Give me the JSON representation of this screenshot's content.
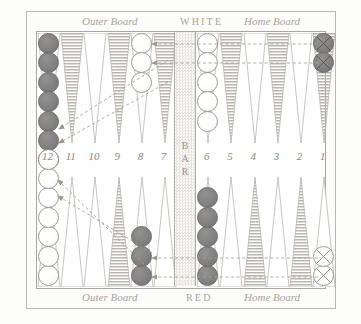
{
  "board": {
    "title_top_center": "WHITE",
    "title_bottom_center": "RED",
    "label_outer_board": "Outer Board",
    "label_home_board": "Home Board",
    "bar_label": "BAR",
    "colors": {
      "red_checker": "#807f80",
      "white_checker": "#fdfdfc",
      "point_hatch": "#b4b1ab",
      "frame": "#b9b6ad",
      "text": "#a9a39a",
      "arrow": "#a39d94"
    },
    "point_numbers": [
      "12",
      "11",
      "10",
      "9",
      "8",
      "7",
      "6",
      "5",
      "4",
      "3",
      "2",
      "1"
    ],
    "top_points": [
      {
        "number": "12",
        "checkers": 7,
        "color": "red",
        "hatched": false,
        "marked": false
      },
      {
        "number": "11",
        "checkers": 0,
        "color": "none",
        "hatched": true,
        "marked": false
      },
      {
        "number": "10",
        "checkers": 0,
        "color": "none",
        "hatched": false,
        "marked": false
      },
      {
        "number": "9",
        "checkers": 0,
        "color": "none",
        "hatched": true,
        "marked": false
      },
      {
        "number": "8",
        "checkers": 3,
        "color": "white",
        "hatched": false,
        "marked": false
      },
      {
        "number": "7",
        "checkers": 0,
        "color": "none",
        "hatched": true,
        "marked": false
      },
      {
        "number": "6",
        "checkers": 5,
        "color": "white",
        "hatched": false,
        "marked": false
      },
      {
        "number": "5",
        "checkers": 0,
        "color": "none",
        "hatched": true,
        "marked": false
      },
      {
        "number": "4",
        "checkers": 0,
        "color": "none",
        "hatched": false,
        "marked": false
      },
      {
        "number": "3",
        "checkers": 0,
        "color": "none",
        "hatched": true,
        "marked": false
      },
      {
        "number": "2",
        "checkers": 0,
        "color": "none",
        "hatched": false,
        "marked": false
      },
      {
        "number": "1",
        "checkers": 2,
        "color": "red",
        "hatched": true,
        "marked": true
      }
    ],
    "bottom_points": [
      {
        "number": "12",
        "checkers": 7,
        "color": "white",
        "hatched": false,
        "marked": false
      },
      {
        "number": "11",
        "checkers": 0,
        "color": "none",
        "hatched": false,
        "marked": false
      },
      {
        "number": "10",
        "checkers": 0,
        "color": "none",
        "hatched": false,
        "marked": false
      },
      {
        "number": "9",
        "checkers": 0,
        "color": "none",
        "hatched": true,
        "marked": false
      },
      {
        "number": "8",
        "checkers": 3,
        "color": "red",
        "hatched": false,
        "marked": false
      },
      {
        "number": "7",
        "checkers": 0,
        "color": "none",
        "hatched": false,
        "marked": false
      },
      {
        "number": "6",
        "checkers": 5,
        "color": "red",
        "hatched": false,
        "marked": false
      },
      {
        "number": "5",
        "checkers": 0,
        "color": "none",
        "hatched": false,
        "marked": false
      },
      {
        "number": "4",
        "checkers": 0,
        "color": "none",
        "hatched": true,
        "marked": false
      },
      {
        "number": "3",
        "checkers": 0,
        "color": "none",
        "hatched": false,
        "marked": false
      },
      {
        "number": "2",
        "checkers": 0,
        "color": "none",
        "hatched": true,
        "marked": false
      },
      {
        "number": "1",
        "checkers": 2,
        "color": "white",
        "hatched": false,
        "marked": true
      }
    ]
  }
}
